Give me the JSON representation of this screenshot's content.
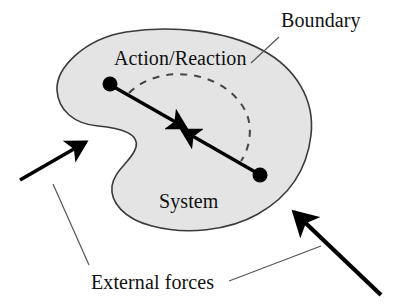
{
  "figure": {
    "background_color": "#ffffff"
  },
  "labels": {
    "boundary": "Boundary",
    "action_reaction": "Action/Reaction",
    "system": "System",
    "external_forces": "External forces"
  },
  "colors": {
    "blob_fill": "#e4e4e4",
    "blob_stroke": "#3a3a3a",
    "arrow_fill": "#000000",
    "leader_line": "#555555",
    "dashed_arc": "#444444",
    "text": "#111111"
  },
  "geometry": {
    "blob_outline_note": "closed irregular amoeba shape, concave on the lower-left side",
    "internal_dots": [
      {
        "name": "action-point",
        "cx": 110,
        "cy": 84,
        "r": 7.5
      },
      {
        "name": "reaction-point",
        "cx": 260,
        "cy": 175,
        "r": 7.5
      }
    ],
    "internal_arrows": [
      {
        "name": "action-arrow",
        "from": [
          110,
          84
        ],
        "to": [
          190,
          130
        ],
        "direction": "down-right"
      },
      {
        "name": "reaction-arrow",
        "from": [
          260,
          175
        ],
        "to": [
          178,
          128
        ],
        "direction": "up-left"
      }
    ],
    "dashed_arc": {
      "from": [
        128,
        92
      ],
      "to": [
        243,
        160
      ],
      "bulge": "up-right"
    },
    "external_arrows": [
      {
        "name": "external-force-arrow-left",
        "from": [
          20,
          180
        ],
        "to": [
          92,
          138
        ],
        "direction": "up-right"
      },
      {
        "name": "external-force-arrow-right",
        "from": [
          381,
          295
        ],
        "to": [
          287,
          205
        ],
        "direction": "up-left"
      }
    ],
    "leader_lines": [
      {
        "name": "boundary-leader",
        "from": [
          277,
          38
        ],
        "to": [
          252,
          62
        ]
      },
      {
        "name": "external-left-leader",
        "from": [
          88,
          266
        ],
        "to": [
          54,
          185
        ]
      },
      {
        "name": "external-right-leader",
        "from": [
          228,
          281
        ],
        "to": [
          320,
          246
        ]
      }
    ]
  }
}
